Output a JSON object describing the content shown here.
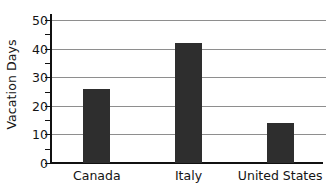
{
  "chart_data": {
    "type": "bar",
    "title": "",
    "xlabel": "",
    "ylabel": "Vacation Days",
    "categories": [
      "Canada",
      "Italy",
      "United States"
    ],
    "values": [
      26,
      42,
      14
    ],
    "ylim": [
      0,
      50
    ],
    "y_ticks": [
      0,
      10,
      20,
      30,
      40,
      50
    ],
    "y_tick_labels": [
      "0",
      "10",
      "20",
      "30",
      "40",
      "50"
    ],
    "y_minor_ticks": [
      5,
      15,
      25,
      35,
      45
    ],
    "grid": true,
    "grid_axis": "y",
    "legend": null,
    "bar_color": "#2e2e2e",
    "gridline_color": "#8e8e8e",
    "axis_color": "#111111"
  },
  "axis": {
    "y_title": "Vacation Days"
  },
  "ticks": {
    "y": [
      {
        "label": "50",
        "value": 50
      },
      {
        "label": "40",
        "value": 40
      },
      {
        "label": "30",
        "value": 30
      },
      {
        "label": "20",
        "value": 20
      },
      {
        "label": "10",
        "value": 10
      },
      {
        "label": "0",
        "value": 0
      }
    ],
    "x": [
      {
        "label": "Canada"
      },
      {
        "label": "Italy"
      },
      {
        "label": "United States"
      }
    ]
  }
}
